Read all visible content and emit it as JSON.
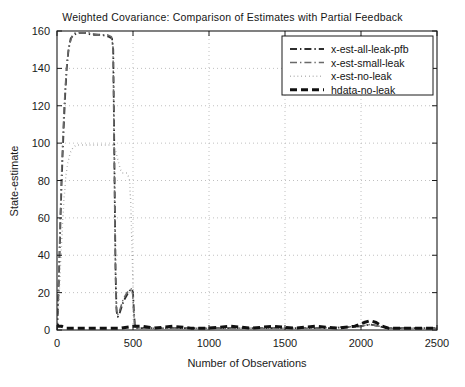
{
  "chart_data": {
    "type": "line",
    "title": "Weighted Covariance: Comparison of Estimates with Partial Feedback",
    "xlabel": "Number of Observations",
    "ylabel": "State-estimate",
    "xlim": [
      0,
      2500
    ],
    "ylim": [
      0,
      160
    ],
    "xticks": [
      0,
      500,
      1000,
      1500,
      2000,
      2500
    ],
    "yticks": [
      0,
      20,
      40,
      60,
      80,
      100,
      120,
      140,
      160
    ],
    "grid": true,
    "grid_style": "dotted",
    "grid_color": "#b9b9b9",
    "legend_position": "top-right",
    "series": [
      {
        "name": "x-est-all-leak-pfb",
        "style": "dash-dot",
        "color": "#2e2e2e",
        "width": 1.8,
        "points": [
          [
            0,
            0
          ],
          [
            6,
            10
          ],
          [
            12,
            26
          ],
          [
            18,
            44
          ],
          [
            24,
            62
          ],
          [
            30,
            78
          ],
          [
            38,
            96
          ],
          [
            46,
            112
          ],
          [
            54,
            126
          ],
          [
            64,
            140
          ],
          [
            76,
            150
          ],
          [
            90,
            156
          ],
          [
            110,
            158
          ],
          [
            140,
            159
          ],
          [
            180,
            159
          ],
          [
            230,
            158
          ],
          [
            290,
            158
          ],
          [
            340,
            157
          ],
          [
            362,
            156
          ],
          [
            370,
            150
          ],
          [
            374,
            120
          ],
          [
            378,
            88
          ],
          [
            382,
            56
          ],
          [
            386,
            28
          ],
          [
            392,
            10
          ],
          [
            400,
            7
          ],
          [
            412,
            9
          ],
          [
            424,
            12
          ],
          [
            436,
            15
          ],
          [
            448,
            17
          ],
          [
            462,
            19
          ],
          [
            478,
            21
          ],
          [
            492,
            22
          ],
          [
            500,
            20
          ],
          [
            506,
            10
          ],
          [
            512,
            3
          ],
          [
            520,
            1
          ],
          [
            560,
            1
          ],
          [
            700,
            1
          ],
          [
            1000,
            1
          ],
          [
            1400,
            1
          ],
          [
            1800,
            1
          ],
          [
            2000,
            2
          ],
          [
            2060,
            3
          ],
          [
            2120,
            2
          ],
          [
            2160,
            1
          ],
          [
            2300,
            1
          ],
          [
            2500,
            1
          ]
        ]
      },
      {
        "name": "x-est-small-leak",
        "style": "dash-dot",
        "color": "#6a6a6a",
        "width": 1.5,
        "points": [
          [
            0,
            0
          ],
          [
            6,
            12
          ],
          [
            12,
            30
          ],
          [
            18,
            50
          ],
          [
            24,
            68
          ],
          [
            30,
            84
          ],
          [
            38,
            102
          ],
          [
            46,
            118
          ],
          [
            56,
            132
          ],
          [
            66,
            144
          ],
          [
            80,
            152
          ],
          [
            98,
            157
          ],
          [
            120,
            159
          ],
          [
            160,
            159
          ],
          [
            210,
            159
          ],
          [
            270,
            158
          ],
          [
            330,
            158
          ],
          [
            358,
            157
          ],
          [
            368,
            152
          ],
          [
            372,
            126
          ],
          [
            376,
            94
          ],
          [
            380,
            62
          ],
          [
            384,
            34
          ],
          [
            390,
            12
          ],
          [
            398,
            8
          ],
          [
            410,
            10
          ],
          [
            422,
            13
          ],
          [
            434,
            16
          ],
          [
            446,
            18
          ],
          [
            460,
            20
          ],
          [
            476,
            21
          ],
          [
            490,
            22
          ],
          [
            498,
            19
          ],
          [
            505,
            9
          ],
          [
            511,
            3
          ],
          [
            520,
            1
          ],
          [
            600,
            1
          ],
          [
            900,
            1
          ],
          [
            1300,
            1
          ],
          [
            1700,
            1
          ],
          [
            2000,
            2
          ],
          [
            2060,
            3
          ],
          [
            2120,
            2
          ],
          [
            2200,
            1
          ],
          [
            2500,
            1
          ]
        ]
      },
      {
        "name": "x-est-no-leak",
        "style": "dotted",
        "color": "#8a8a8a",
        "width": 1.4,
        "points": [
          [
            0,
            0
          ],
          [
            8,
            8
          ],
          [
            16,
            22
          ],
          [
            26,
            40
          ],
          [
            36,
            56
          ],
          [
            46,
            70
          ],
          [
            58,
            82
          ],
          [
            72,
            90
          ],
          [
            88,
            95
          ],
          [
            108,
            98
          ],
          [
            130,
            99
          ],
          [
            160,
            99
          ],
          [
            200,
            99
          ],
          [
            250,
            99
          ],
          [
            300,
            99
          ],
          [
            340,
            99
          ],
          [
            368,
            99
          ],
          [
            380,
            97
          ],
          [
            392,
            94
          ],
          [
            404,
            90
          ],
          [
            416,
            86
          ],
          [
            430,
            84
          ],
          [
            446,
            84
          ],
          [
            462,
            84
          ],
          [
            478,
            80
          ],
          [
            486,
            66
          ],
          [
            492,
            48
          ],
          [
            498,
            30
          ],
          [
            504,
            14
          ],
          [
            510,
            5
          ],
          [
            518,
            2
          ],
          [
            540,
            1
          ],
          [
            800,
            1
          ],
          [
            1200,
            1
          ],
          [
            1600,
            1
          ],
          [
            2000,
            2
          ],
          [
            2060,
            3
          ],
          [
            2120,
            2
          ],
          [
            2200,
            1
          ],
          [
            2500,
            1
          ]
        ]
      },
      {
        "name": "hdata-no-leak",
        "style": "dashed-thick",
        "color": "#111111",
        "width": 3.0,
        "points": [
          [
            0,
            3
          ],
          [
            10,
            2
          ],
          [
            30,
            2
          ],
          [
            60,
            1
          ],
          [
            100,
            1
          ],
          [
            160,
            1
          ],
          [
            240,
            1
          ],
          [
            340,
            1
          ],
          [
            420,
            1
          ],
          [
            500,
            2
          ],
          [
            560,
            2
          ],
          [
            640,
            1
          ],
          [
            760,
            2
          ],
          [
            880,
            1
          ],
          [
            1000,
            1
          ],
          [
            1140,
            2
          ],
          [
            1280,
            1
          ],
          [
            1420,
            2
          ],
          [
            1560,
            1
          ],
          [
            1700,
            2
          ],
          [
            1840,
            1
          ],
          [
            1960,
            2
          ],
          [
            2020,
            4
          ],
          [
            2060,
            5
          ],
          [
            2100,
            4
          ],
          [
            2140,
            2
          ],
          [
            2180,
            1
          ],
          [
            2260,
            1
          ],
          [
            2400,
            1
          ],
          [
            2500,
            1
          ]
        ]
      }
    ]
  },
  "legend": {
    "items": [
      {
        "label": "x-est-all-leak-pfb",
        "style": "dash-dot"
      },
      {
        "label": "x-est-small-leak",
        "style": "dash-dot"
      },
      {
        "label": "x-est-no-leak",
        "style": "dotted"
      },
      {
        "label": "hdata-no-leak",
        "style": "dashed-thick"
      }
    ]
  }
}
